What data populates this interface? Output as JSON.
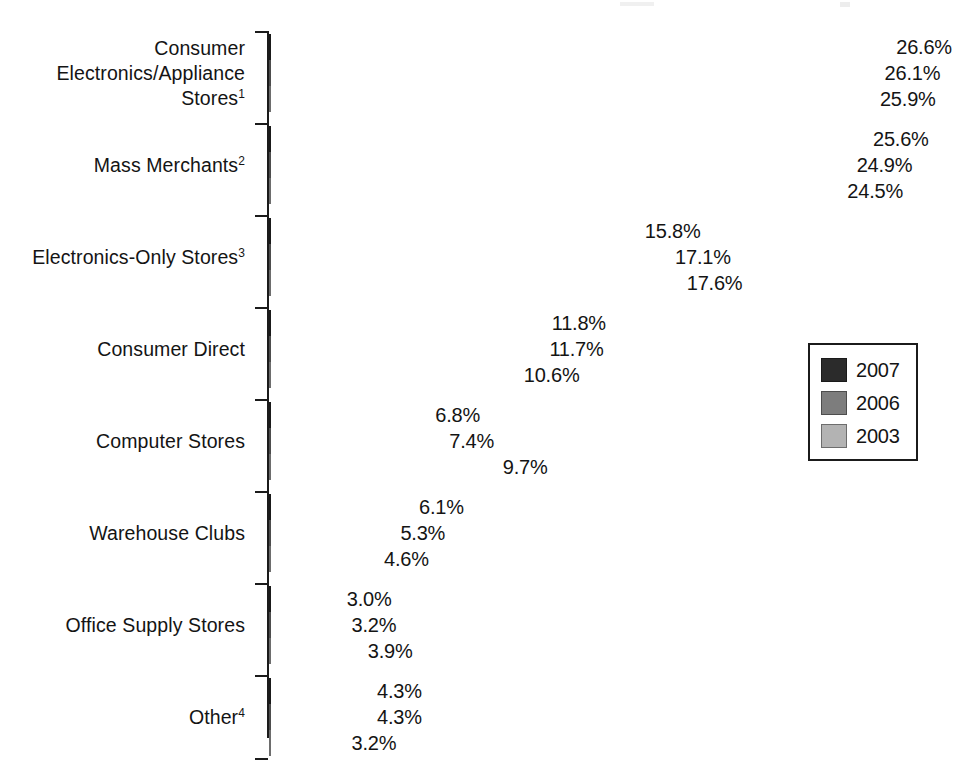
{
  "chart_data": {
    "type": "bar",
    "orientation": "horizontal",
    "title": "",
    "subtitle": "",
    "xlabel": "",
    "ylabel": "",
    "grid": false,
    "legend_position": "right",
    "xlim": [
      0,
      26.6
    ],
    "value_suffix": "%",
    "categories": [
      "Consumer Electronics/Appliance Stores",
      "Mass Merchants",
      "Electronics-Only Stores",
      "Consumer Direct",
      "Computer Stores",
      "Warehouse Clubs",
      "Office Supply Stores",
      "Other"
    ],
    "category_lines": [
      [
        "Consumer",
        "Electronics/Appliance",
        "Stores"
      ],
      [
        "Mass Merchants"
      ],
      [
        "Electronics-Only Stores"
      ],
      [
        "Consumer Direct"
      ],
      [
        "Computer Stores"
      ],
      [
        "Warehouse Clubs"
      ],
      [
        "Office Supply Stores"
      ],
      [
        "Other"
      ]
    ],
    "category_footnotes": [
      "1",
      "2",
      "3",
      "",
      "",
      "",
      "",
      "4"
    ],
    "series": [
      {
        "name": "2007",
        "color": "#2b2b2b",
        "values": [
          26.6,
          25.6,
          15.8,
          11.8,
          6.8,
          6.1,
          3.0,
          4.3
        ],
        "labels": [
          "26.6%",
          "25.6%",
          "15.8%",
          "11.8%",
          "6.8%",
          "6.1%",
          "3.0%",
          "4.3%"
        ]
      },
      {
        "name": "2006",
        "color": "#7d7d7d",
        "values": [
          26.1,
          24.9,
          17.1,
          11.7,
          7.4,
          5.3,
          3.2,
          4.3
        ],
        "labels": [
          "26.1%",
          "24.9%",
          "17.1%",
          "11.7%",
          "7.4%",
          "5.3%",
          "3.2%",
          "4.3%"
        ]
      },
      {
        "name": "2003",
        "color": "#b3b3b3",
        "values": [
          25.9,
          24.5,
          17.6,
          10.6,
          9.7,
          4.6,
          3.9,
          3.2
        ],
        "labels": [
          "25.9%",
          "24.5%",
          "17.6%",
          "10.6%",
          "9.7%",
          "4.6%",
          "3.9%",
          "3.2%"
        ]
      }
    ]
  },
  "legend": {
    "items": [
      {
        "label": "2007",
        "series_class": "s0"
      },
      {
        "label": "2006",
        "series_class": "s1"
      },
      {
        "label": "2003",
        "series_class": "s2"
      }
    ]
  },
  "axis": {
    "tick_count": 9
  }
}
